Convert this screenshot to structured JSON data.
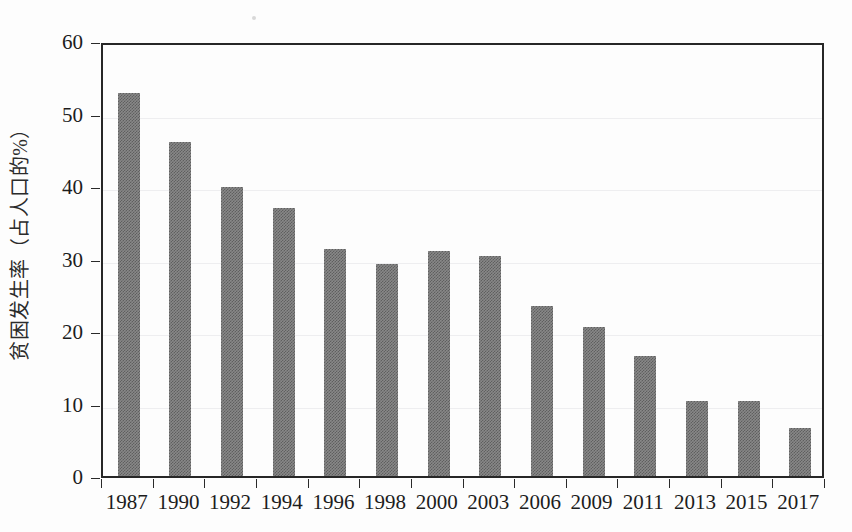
{
  "chart_data": {
    "type": "bar",
    "title": "",
    "subtitle": "",
    "xlabel": "",
    "ylabel": "贫困发生率（占人口的%）",
    "categories": [
      "1987",
      "1990",
      "1992",
      "1994",
      "1996",
      "1998",
      "2000",
      "2003",
      "2006",
      "2009",
      "2011",
      "2013",
      "2015",
      "2017"
    ],
    "values": [
      52.8,
      46.1,
      39.8,
      36.9,
      31.3,
      29.2,
      31.1,
      30.4,
      23.5,
      20.6,
      16.6,
      10.4,
      10.4,
      6.6
    ],
    "ylim": [
      0,
      60
    ],
    "yticks": [
      0,
      10,
      20,
      30,
      40,
      50,
      60
    ],
    "ytick_labels": [
      "0",
      "10",
      "20",
      "30",
      "40",
      "50",
      "60"
    ],
    "grid": true,
    "grid_axis": "y",
    "legend": false,
    "legend_position": "none",
    "series": [
      {
        "name": "贫困发生率",
        "color": "#808080",
        "values": [
          52.8,
          46.1,
          39.8,
          36.9,
          31.3,
          29.2,
          31.1,
          30.4,
          23.5,
          20.6,
          16.6,
          10.4,
          10.4,
          6.6
        ]
      }
    ]
  },
  "colors": {
    "bar_fill": "#808080",
    "axis": "#272727",
    "grid": "#eeeef0",
    "text": "#1c1c1c",
    "background": "#fdfdfd"
  }
}
